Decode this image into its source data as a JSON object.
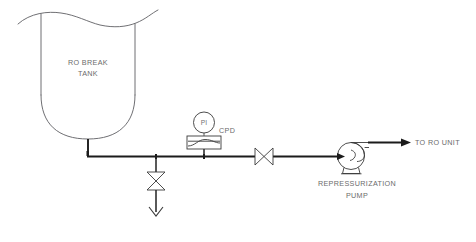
{
  "diagram": {
    "background_color": "#ffffff",
    "line_color": "#1b1b1b",
    "symbol_color": "#3a3a3a",
    "vessel_color": "#5f5f63",
    "text_color": "#6b6b6b"
  },
  "tank": {
    "label_line1": "RO BREAK",
    "label_line2": "TANK",
    "symbol": "open-top-tank-with-dished-bottom"
  },
  "instrument": {
    "gauge_tag": "PI",
    "equipment_tag": "CPD",
    "gauge_symbol": "circle-instrument-bubble",
    "body_symbol": "cartridge-filter-box"
  },
  "valves": [
    {
      "name": "drain-valve",
      "symbol": "gate-valve-bowtie-vertical",
      "orientation": "vertical"
    },
    {
      "name": "pump-suction-valve",
      "symbol": "gate-valve-bowtie-horizontal",
      "orientation": "horizontal"
    }
  ],
  "drain": {
    "symbol": "open-discharge-arrow",
    "label": ""
  },
  "pump": {
    "label_line1": "REPRESSURIZATION",
    "label_line2": "PUMP",
    "symbol": "centrifugal-pump"
  },
  "outlet": {
    "label": "TO RO UNIT",
    "symbol": "flow-direction-arrow"
  }
}
